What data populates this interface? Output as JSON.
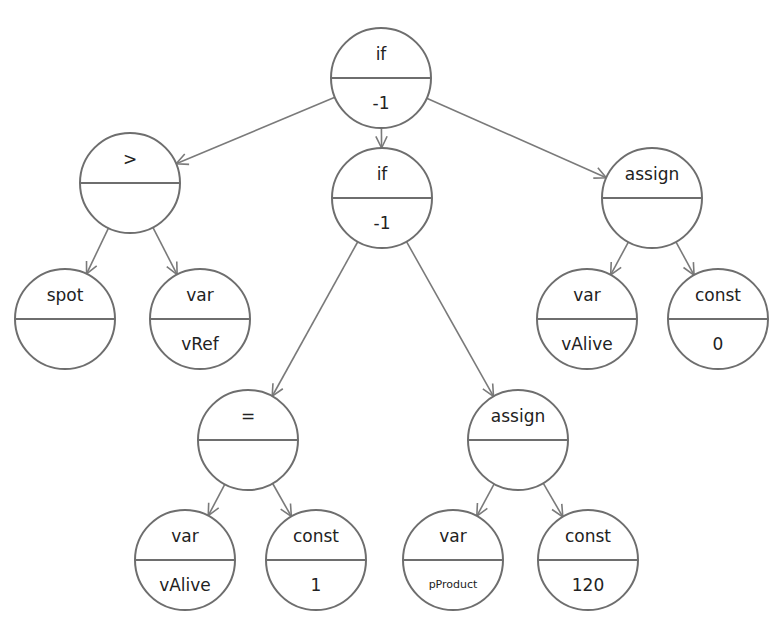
{
  "colors": {
    "stroke": "#6e6e6e",
    "edge": "#7a7a7a",
    "text": "#222222",
    "background": "#ffffff"
  },
  "nodes": [
    {
      "id": "root-if",
      "top": "if",
      "bottom": "-1",
      "cx": 381,
      "cy": 78,
      "r": 50
    },
    {
      "id": "gt",
      "top": ">",
      "bottom": "",
      "cx": 130,
      "cy": 183,
      "r": 50
    },
    {
      "id": "mid-if",
      "top": "if",
      "bottom": "-1",
      "cx": 382,
      "cy": 198,
      "r": 50
    },
    {
      "id": "assign-right",
      "top": "assign",
      "bottom": "",
      "cx": 652,
      "cy": 198,
      "r": 50
    },
    {
      "id": "spot",
      "top": "spot",
      "bottom": "",
      "cx": 65,
      "cy": 319,
      "r": 50
    },
    {
      "id": "var-vref",
      "top": "var",
      "bottom": "vRef",
      "cx": 200,
      "cy": 319,
      "r": 50
    },
    {
      "id": "var-valive-r",
      "top": "var",
      "bottom": "vAlive",
      "cx": 587,
      "cy": 319,
      "r": 50
    },
    {
      "id": "const-0",
      "top": "const",
      "bottom": "0",
      "cx": 718,
      "cy": 319,
      "r": 50
    },
    {
      "id": "eq",
      "top": "=",
      "bottom": "",
      "cx": 248,
      "cy": 440,
      "r": 50
    },
    {
      "id": "assign-bottom",
      "top": "assign",
      "bottom": "",
      "cx": 518,
      "cy": 440,
      "r": 50
    },
    {
      "id": "var-valive-b",
      "top": "var",
      "bottom": "vAlive",
      "cx": 185,
      "cy": 560,
      "r": 50
    },
    {
      "id": "const-1",
      "top": "const",
      "bottom": "1",
      "cx": 316,
      "cy": 560,
      "r": 50
    },
    {
      "id": "var-pproduct",
      "top": "var",
      "bottom": "pProduct",
      "cx": 453,
      "cy": 560,
      "r": 50,
      "small": true
    },
    {
      "id": "const-120",
      "top": "const",
      "bottom": "120",
      "cx": 588,
      "cy": 560,
      "r": 50
    }
  ],
  "edges": [
    {
      "from": "root-if",
      "to": "gt"
    },
    {
      "from": "root-if",
      "to": "mid-if"
    },
    {
      "from": "root-if",
      "to": "assign-right"
    },
    {
      "from": "gt",
      "to": "spot"
    },
    {
      "from": "gt",
      "to": "var-vref"
    },
    {
      "from": "assign-right",
      "to": "var-valive-r"
    },
    {
      "from": "assign-right",
      "to": "const-0"
    },
    {
      "from": "mid-if",
      "to": "eq"
    },
    {
      "from": "mid-if",
      "to": "assign-bottom"
    },
    {
      "from": "eq",
      "to": "var-valive-b"
    },
    {
      "from": "eq",
      "to": "const-1"
    },
    {
      "from": "assign-bottom",
      "to": "var-pproduct"
    },
    {
      "from": "assign-bottom",
      "to": "const-120"
    }
  ]
}
